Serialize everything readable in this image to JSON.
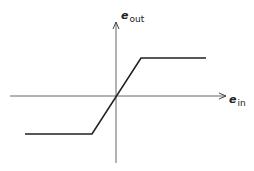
{
  "diagram": {
    "type": "saturation-transfer-characteristic",
    "y_axis": {
      "symbol": "e",
      "subscript": "out"
    },
    "x_axis": {
      "symbol": "e",
      "subscript": "in"
    },
    "curve": {
      "description": "Piecewise-linear limiter: flat negative saturation, linear region through origin, flat positive saturation",
      "points_px": [
        [
          25,
          134
        ],
        [
          92,
          134
        ],
        [
          141,
          58
        ],
        [
          206,
          58
        ]
      ]
    },
    "colors": {
      "axis": "#444444",
      "curve": "#222222",
      "background": "#ffffff"
    }
  }
}
